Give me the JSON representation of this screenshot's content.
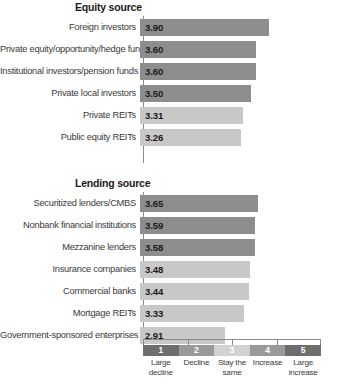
{
  "chart_data": {
    "type": "bar",
    "title": "",
    "xlabel": "",
    "ylabel": "",
    "xlim": [
      1,
      5
    ],
    "grid": false,
    "orientation": "horizontal",
    "axis_ticks": [
      "1",
      "2",
      "3",
      "4",
      "5"
    ],
    "panels": [
      {
        "title": "Equity source",
        "categories": [
          "Foreign investors",
          "Private equity/opportunity/hedge funds",
          "Institutional investors/pension funds",
          "Private local investors",
          "Private REITs",
          "Public equity REITs"
        ],
        "values": [
          3.9,
          3.6,
          3.6,
          3.5,
          3.31,
          3.26
        ],
        "value_labels": [
          "3.90",
          "3.60",
          "3.60",
          "3.50",
          "3.31",
          "3.26"
        ],
        "shades": [
          "dark",
          "dark",
          "dark",
          "dark",
          "light",
          "light"
        ]
      },
      {
        "title": "Lending source",
        "categories": [
          "Securitized lenders/CMBS",
          "Nonbank financial institutions",
          "Mezzanine lenders",
          "Insurance companies",
          "Commercial banks",
          "Mortgage REITs",
          "Government-sponsored enterprises"
        ],
        "values": [
          3.65,
          3.59,
          3.58,
          3.48,
          3.44,
          3.33,
          2.91
        ],
        "value_labels": [
          "3.65",
          "3.59",
          "3.58",
          "3.48",
          "3.44",
          "3.33",
          "2.91"
        ],
        "shades": [
          "dark",
          "dark",
          "dark",
          "light",
          "light",
          "light",
          "light"
        ]
      }
    ],
    "legend": {
      "position": "bottom",
      "entries": [
        {
          "number": "1",
          "label": "Large decline",
          "color": "#6e6e6e"
        },
        {
          "number": "2",
          "label": "Decline",
          "color": "#9a9a9a"
        },
        {
          "number": "3",
          "label": "Stay the same",
          "color": "#d2d2d2"
        },
        {
          "number": "4",
          "label": "Increase",
          "color": "#9a9a9a"
        },
        {
          "number": "5",
          "label": "Large increase",
          "color": "#6e6e6e"
        }
      ]
    },
    "colors": {
      "bar_dark": "#8d8d8d",
      "bar_light": "#c8c8c8",
      "axis": "#8a8a8a",
      "text": "#231f20"
    }
  }
}
